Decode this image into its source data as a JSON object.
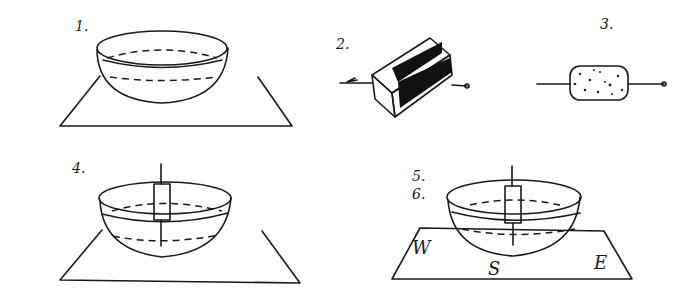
{
  "diagram": {
    "steps": [
      {
        "id": "1",
        "label": "1.",
        "depicts": "bowl of water on flat surface"
      },
      {
        "id": "2",
        "label": "2.",
        "depicts": "needle stroked along magnet (arrow direction)"
      },
      {
        "id": "3",
        "label": "3.",
        "depicts": "needle pushed through cork"
      },
      {
        "id": "4",
        "label": "4.",
        "depicts": "cork with needle floating in bowl"
      },
      {
        "id": "5",
        "label": "5.",
        "depicts": "needle aligns"
      },
      {
        "id": "6",
        "label": "6.",
        "depicts": "compass directions marked"
      }
    ],
    "directions": {
      "west": "W",
      "south": "S",
      "east": "E"
    },
    "colors": {
      "ink": "#1a1a1a",
      "background": "#ffffff"
    }
  }
}
